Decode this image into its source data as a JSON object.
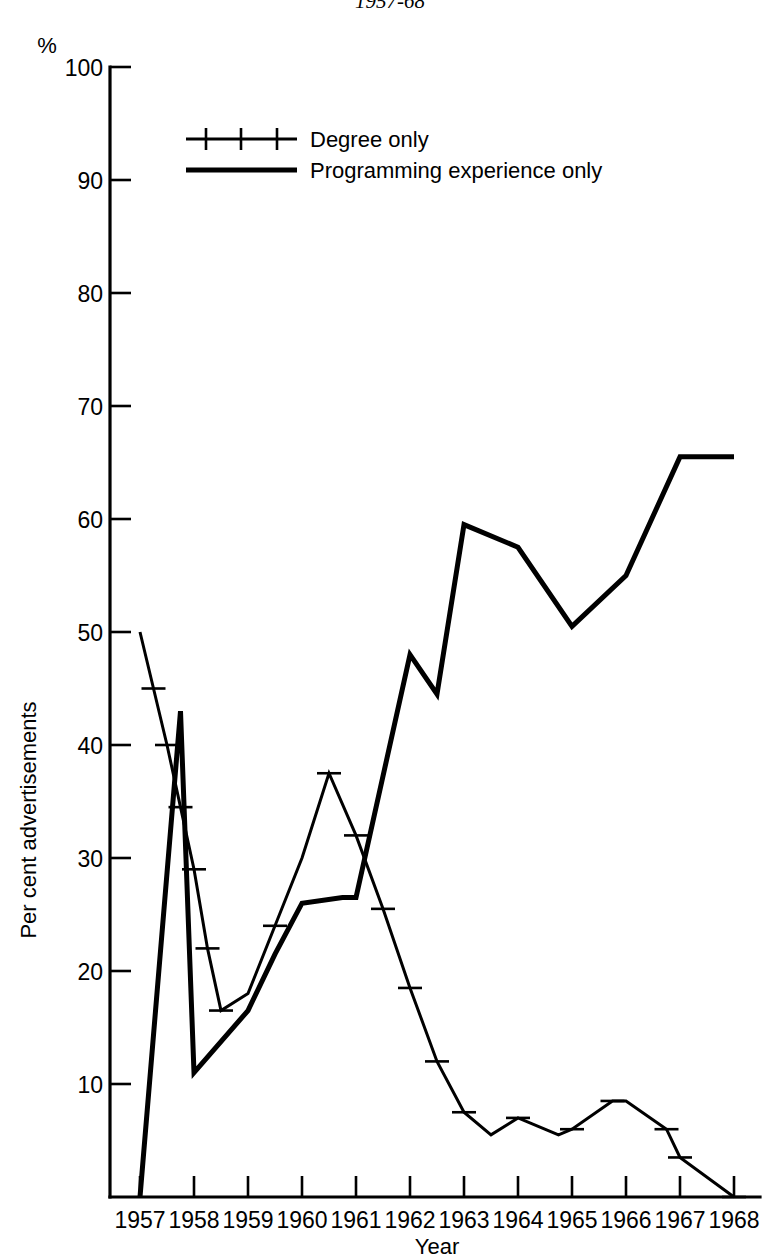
{
  "chart_data": {
    "type": "line",
    "title": "1957-68",
    "xlabel": "Year",
    "ylabel": "Per cent advertisements",
    "y_unit_symbol": "%",
    "xlim": [
      1957,
      1968
    ],
    "ylim": [
      0,
      100
    ],
    "grid": false,
    "legend_position": "upper-left-inside",
    "x_tick_labels": [
      "1957",
      "1958",
      "1959",
      "1960",
      "1961",
      "1962",
      "1963",
      "1964",
      "1965",
      "1966",
      "1967",
      "1968"
    ],
    "x_ticks": [
      1957,
      1958,
      1959,
      1960,
      1961,
      1962,
      1963,
      1964,
      1965,
      1966,
      1967,
      1968
    ],
    "y_tick_labels": [
      "10",
      "20",
      "30",
      "40",
      "50",
      "60",
      "70",
      "80",
      "90",
      "100"
    ],
    "y_ticks": [
      10,
      20,
      30,
      40,
      50,
      60,
      70,
      80,
      90,
      100
    ],
    "series": [
      {
        "name": "Degree only",
        "style": "line-with-cross-markers",
        "marker": "cross",
        "x": [
          1957.0,
          1957.25,
          1957.5,
          1957.75,
          1958.0,
          1958.25,
          1958.5,
          1959.0,
          1959.5,
          1960.0,
          1960.5,
          1961.0,
          1961.5,
          1962.0,
          1962.5,
          1963.0,
          1963.5,
          1964.0,
          1964.75,
          1965.0,
          1965.75,
          1966.0,
          1966.75,
          1967.0,
          1968.0
        ],
        "values": [
          50.0,
          45.0,
          40.0,
          34.5,
          29.0,
          22.0,
          16.5,
          18.0,
          24.0,
          30.0,
          37.5,
          32.0,
          25.5,
          18.5,
          12.0,
          7.5,
          5.5,
          7.0,
          5.5,
          6.0,
          8.5,
          8.5,
          6.0,
          3.5,
          0.0
        ],
        "marker_x": [
          1957.25,
          1957.5,
          1957.75,
          1958.0,
          1958.25,
          1958.5,
          1959.5,
          1960.5,
          1961.0,
          1961.5,
          1962.0,
          1962.5,
          1963.0,
          1964.0,
          1965.0,
          1965.75,
          1966.75,
          1967.0,
          1968.0
        ],
        "marker_values": [
          45.0,
          40.0,
          34.5,
          29.0,
          22.0,
          16.5,
          24.0,
          37.5,
          32.0,
          25.5,
          18.5,
          12.0,
          7.5,
          7.0,
          6.0,
          8.5,
          6.0,
          3.5,
          0.0
        ]
      },
      {
        "name": "Programming experience only",
        "style": "thick-solid-line",
        "marker": "none",
        "x": [
          1957.0,
          1957.75,
          1958.0,
          1959.0,
          1959.5,
          1960.0,
          1960.75,
          1961.0,
          1962.0,
          1962.5,
          1963.0,
          1964.0,
          1965.0,
          1966.0,
          1967.0,
          1968.0
        ],
        "values": [
          0.0,
          43.0,
          11.0,
          16.5,
          21.5,
          26.0,
          26.5,
          26.5,
          48.0,
          44.5,
          59.5,
          57.5,
          50.5,
          55.0,
          65.5,
          65.5
        ]
      }
    ],
    "legend": [
      {
        "label": "Degree only",
        "style": "line-with-cross-markers"
      },
      {
        "label": "Programming experience only",
        "style": "thick-solid-line"
      }
    ]
  }
}
